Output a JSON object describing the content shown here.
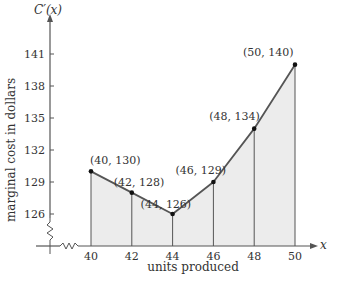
{
  "chart_data": {
    "type": "area",
    "title": "",
    "xlabel": "units produced",
    "ylabel": "marginal cost in dollars",
    "x_axis_var": "x",
    "y_axis_var": "C′(x)",
    "x": [
      40,
      42,
      44,
      46,
      48,
      50
    ],
    "series": [
      {
        "name": "C'(x)",
        "values": [
          130,
          128,
          126,
          129,
          134,
          140
        ]
      }
    ],
    "point_labels": [
      "(40, 130)",
      "(42, 128)",
      "(44, 126)",
      "(46, 129)",
      "(48, 134)",
      "(50, 140)"
    ],
    "x_ticks": [
      40,
      42,
      44,
      46,
      48,
      50
    ],
    "y_ticks": [
      126,
      129,
      132,
      135,
      138,
      141
    ],
    "xlim": [
      40,
      50
    ],
    "ylim": [
      126,
      141
    ],
    "axis_breaks": true,
    "vertical_lines_at_points": true,
    "grid": false,
    "legend": "none",
    "colors": {
      "line": "#555555",
      "fill": "#ececec",
      "axis": "#555555",
      "point": "#111111"
    }
  }
}
